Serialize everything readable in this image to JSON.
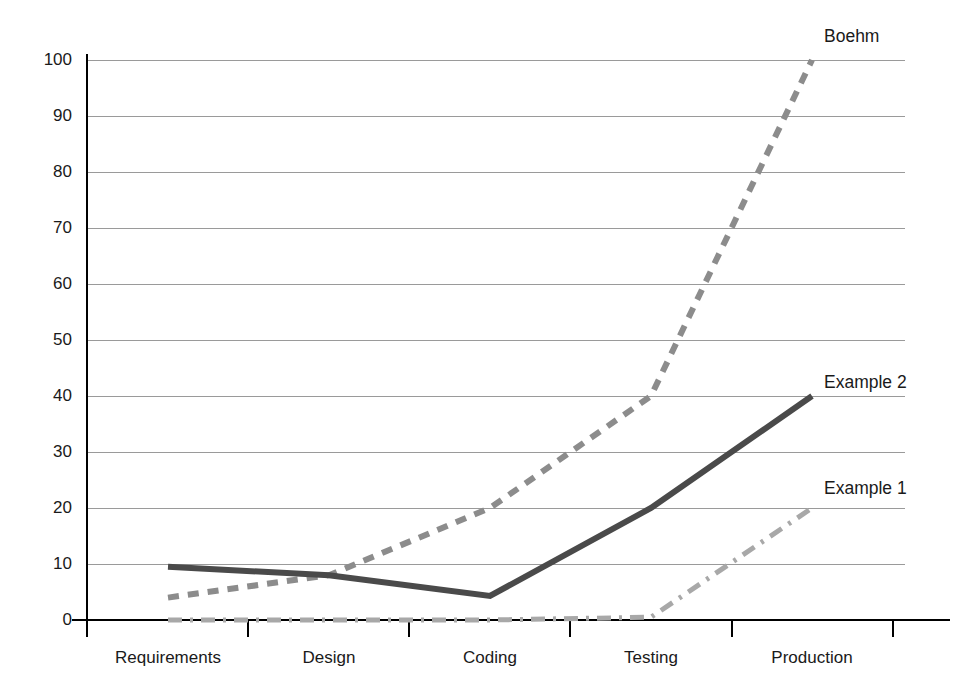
{
  "chart_data": {
    "type": "line",
    "title": "",
    "subtitle": "",
    "xlabel": "",
    "ylabel": "",
    "categories": [
      "Requirements",
      "Design",
      "Coding",
      "Testing",
      "Production"
    ],
    "yticks": [
      0,
      10,
      20,
      30,
      40,
      50,
      60,
      70,
      80,
      90,
      100
    ],
    "ytick_labels": [
      "0",
      "10",
      "20",
      "30",
      "40",
      "50",
      "60",
      "70",
      "80",
      "90",
      "100"
    ],
    "ylim": [
      0,
      100
    ],
    "grid": true,
    "legend_position": "right-inline-annotations",
    "series": [
      {
        "name": "Boehm",
        "values": [
          4,
          8,
          20,
          40,
          100
        ],
        "style": "dashed",
        "color": "#8c8c8c",
        "width": 6,
        "label_y_value": 108
      },
      {
        "name": "Example 2",
        "values": [
          9.5,
          8,
          4.3,
          20,
          40
        ],
        "style": "solid",
        "color": "#4a4a4a",
        "width": 6,
        "label_y_value": 45
      },
      {
        "name": "Example 1",
        "values": [
          0,
          0,
          0,
          0.5,
          20
        ],
        "style": "dashdot",
        "color": "#a8a8a8",
        "width": 5,
        "label_y_value": 25
      }
    ]
  },
  "axis": {
    "y_axis_color": "#000000",
    "x_axis_color": "#000000",
    "gridline_color": "#9a9a9a"
  },
  "labels": {
    "boehm": "Boehm",
    "example2": "Example 2",
    "example1": "Example 1",
    "y0": "0",
    "y10": "10",
    "y20": "20",
    "y30": "30",
    "y40": "40",
    "y50": "50",
    "y60": "60",
    "y70": "70",
    "y80": "80",
    "y90": "90",
    "y100": "100",
    "x_requirements": "Requirements",
    "x_design": "Design",
    "x_coding": "Coding",
    "x_testing": "Testing",
    "x_production": "Production"
  }
}
